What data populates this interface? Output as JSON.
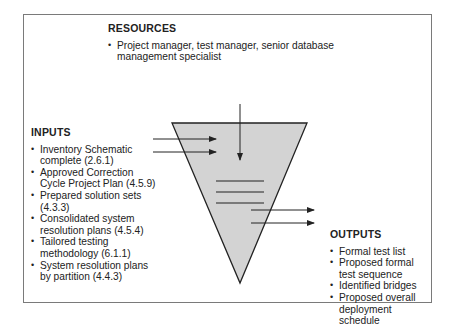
{
  "resources": {
    "title": "RESOURCES",
    "items": [
      "Project manager, test manager, senior database management specialist"
    ]
  },
  "inputs": {
    "title": "INPUTS",
    "items": [
      "Inventory Schematic complete (2.6.1)",
      "Approved Correction Cycle Project Plan (4.5.9)",
      "Prepared solution sets (4.3.3)",
      "Consolidated system resolution plans (4.5.4)",
      "Tailored testing methodology (6.1.1)",
      "System resolution plans by partition (4.4.3)"
    ]
  },
  "outputs": {
    "title": "OUTPUTS",
    "items": [
      "Formal test list",
      "Proposed formal test sequence",
      "Identified bridges",
      "Proposed overall deployment schedule"
    ]
  },
  "colors": {
    "funnel_fill": "#d3d3d3",
    "stroke": "#222222",
    "frame": "#7a7a7a"
  }
}
